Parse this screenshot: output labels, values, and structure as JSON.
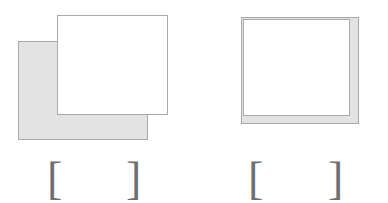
{
  "page": {
    "background_color": "#ffffff",
    "width": 388,
    "height": 203
  },
  "palette": {
    "shape_fill_gray": "#e3e3e3",
    "shape_fill_white": "#ffffff",
    "shape_stroke": "#a9a9a9",
    "bracket_color": "#6f6f6f"
  },
  "figures": [
    {
      "id": "figure-left",
      "shapes": [
        {
          "name": "gray-rectangle",
          "fill": "#e3e3e3",
          "stroke": "#a9a9a9",
          "x": 18,
          "y": 41,
          "width": 130,
          "height": 99,
          "layer": 1
        },
        {
          "name": "white-rectangle",
          "fill": "#ffffff",
          "stroke": "#a9a9a9",
          "x": 57,
          "y": 15,
          "width": 111,
          "height": 100,
          "layer": 2
        }
      ],
      "caption": {
        "open_bracket": "[",
        "close_bracket": "]",
        "text": ""
      }
    },
    {
      "id": "figure-right",
      "shapes": [
        {
          "name": "gray-rectangle",
          "fill": "#e3e3e3",
          "stroke": "#a9a9a9",
          "x": 241,
          "y": 17,
          "width": 118,
          "height": 107,
          "layer": 1
        },
        {
          "name": "white-rectangle",
          "fill": "#ffffff",
          "stroke": "#a9a9a9",
          "x": 243,
          "y": 19,
          "width": 107,
          "height": 97,
          "layer": 2
        }
      ],
      "caption": {
        "open_bracket": "[",
        "close_bracket": "]",
        "text": ""
      }
    }
  ]
}
